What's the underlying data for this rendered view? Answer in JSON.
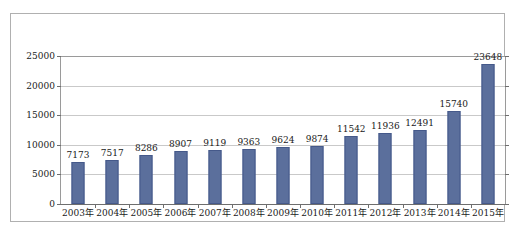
{
  "chart_data": {
    "type": "bar",
    "title": "",
    "subtitle": "",
    "xlabel": "",
    "ylabel": "",
    "categories": [
      "2003年",
      "2004年",
      "2005年",
      "2006年",
      "2007年",
      "2008年",
      "2009年",
      "2010年",
      "2011年",
      "2012年",
      "2013年",
      "2014年",
      "2015年"
    ],
    "values": [
      7173,
      7517,
      8286,
      8907,
      9119,
      9363,
      9624,
      9874,
      11542,
      11936,
      12491,
      15740,
      23648
    ],
    "value_labels": [
      "7173",
      "7517",
      "8286",
      "8907",
      "9119",
      "9363",
      "9624",
      "9874",
      "11542",
      "11936",
      "12491",
      "15740",
      "23648"
    ],
    "ylim": [
      0,
      25000
    ],
    "ytick_values": [
      0,
      5000,
      10000,
      15000,
      20000,
      25000
    ],
    "ytick_labels": [
      "0",
      "5000",
      "10000",
      "15000",
      "20000",
      "25000"
    ],
    "grid": true,
    "grid_axis": "y",
    "legend": false,
    "legend_position": "none",
    "series": [
      {
        "name": "",
        "values": [
          7173,
          7517,
          8286,
          8907,
          9119,
          9363,
          9624,
          9874,
          11542,
          11936,
          12491,
          15740,
          23648
        ]
      }
    ]
  },
  "style": {
    "bar_color": "#5b6f9c",
    "bar_border_color": "#45598a",
    "gridline_color": "#c9c9c9",
    "axis_color": "#6e6e6e",
    "frame_color": "#b0b0b0",
    "background": "#ffffff",
    "text_color": "#1a1a1a"
  }
}
